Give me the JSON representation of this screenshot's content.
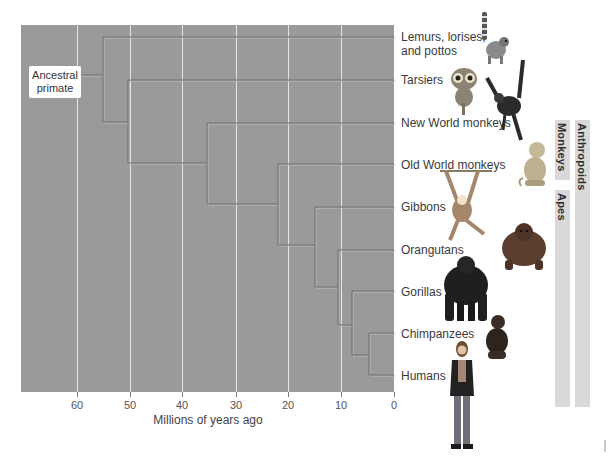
{
  "diagram": {
    "type": "phylogenetic-tree",
    "title": "",
    "ancestor_label": "Ancestral primate",
    "axis": {
      "title": "Millions of years ago",
      "ticks": [
        "60",
        "50",
        "40",
        "30",
        "20",
        "10",
        "0"
      ]
    },
    "taxa": [
      {
        "label": "Lemurs, lorises,\nand pottos",
        "line1": "Lemurs, lorises,",
        "line2": "and pottos"
      },
      {
        "label": "Tarsiers"
      },
      {
        "label": "New World monkeys"
      },
      {
        "label": "Old World monkeys"
      },
      {
        "label": "Gibbons"
      },
      {
        "label": "Orangutans"
      },
      {
        "label": "Gorillas"
      },
      {
        "label": "Chimpanzees"
      },
      {
        "label": "Humans"
      }
    ],
    "divergences_mya": [
      {
        "split": "Lemurs, lorises, and pottos | rest",
        "mya": 55
      },
      {
        "split": "Tarsiers | anthropoids",
        "mya": 50
      },
      {
        "split": "New World monkeys | Old World monkeys + apes",
        "mya": 35
      },
      {
        "split": "Old World monkeys | apes",
        "mya": 22
      },
      {
        "split": "Gibbons | great apes",
        "mya": 15
      },
      {
        "split": "Orangutans | African apes",
        "mya": 11
      },
      {
        "split": "Gorillas | chimpanzees + humans",
        "mya": 8
      },
      {
        "split": "Chimpanzees | humans",
        "mya": 5
      }
    ],
    "groups": [
      {
        "label": "Monkeys"
      },
      {
        "label": "Apes"
      },
      {
        "label": "Anthropoids"
      }
    ],
    "colors": {
      "plot_background": "#9a9a9a",
      "grid_lines": "#e4e4e4",
      "branch_lines": "#6f6f6f",
      "group_bars": "#d9d9d9"
    }
  }
}
